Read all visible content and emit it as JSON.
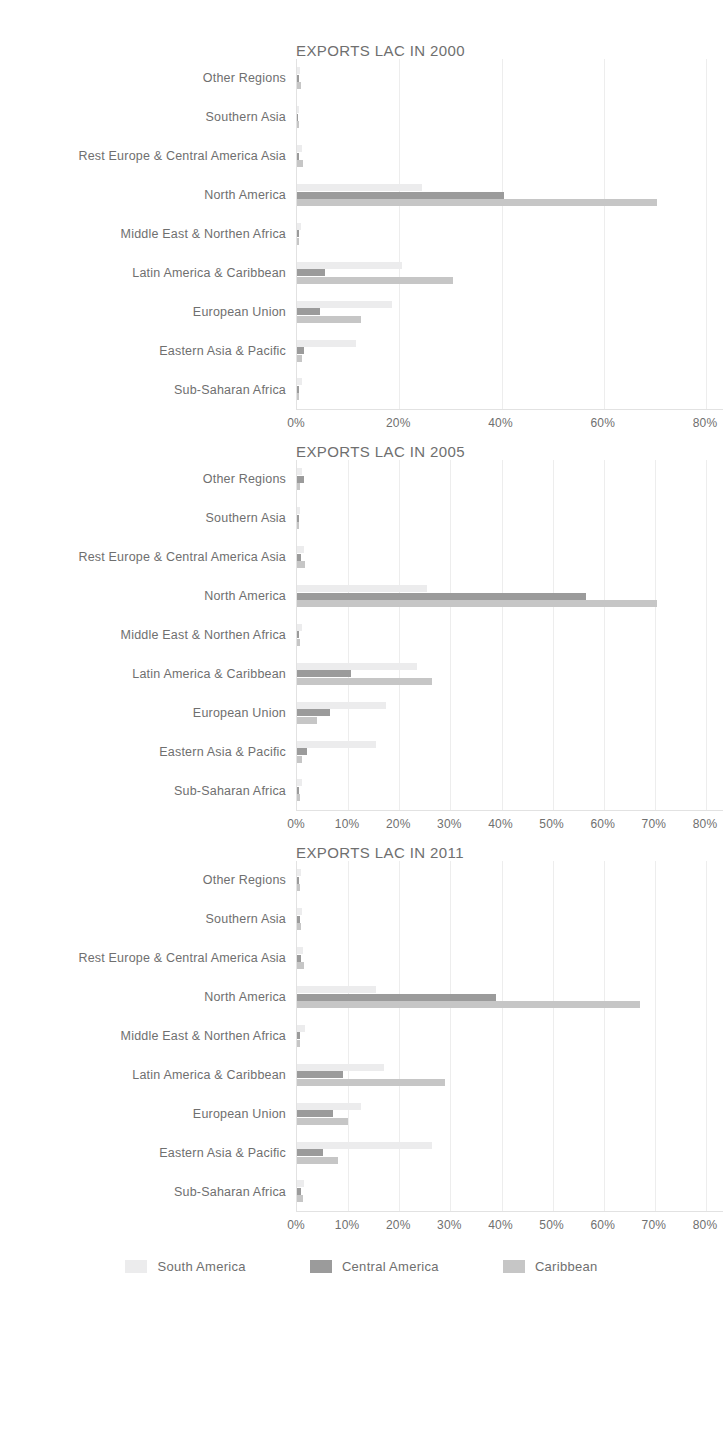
{
  "figure": {
    "series_colors": {
      "south_america": "#ececed",
      "central_america": "#9b9b9b",
      "caribbean": "#c6c6c6"
    }
  },
  "legend": {
    "position": "bottom",
    "items": [
      {
        "label": "South America",
        "swatch": "s0"
      },
      {
        "label": "Central America",
        "swatch": "s1"
      },
      {
        "label": "Caribbean",
        "swatch": "s2"
      }
    ]
  },
  "chart_data": [
    {
      "type": "bar",
      "orientation": "horizontal",
      "title": "EXPORTS LAC IN 2000",
      "xlabel": "",
      "ylabel": "",
      "xlim": [
        0,
        80
      ],
      "xticks": [
        0,
        20,
        40,
        60,
        80
      ],
      "xticklabels": [
        "0%",
        "20%",
        "40%",
        "60%",
        "80%"
      ],
      "grid": true,
      "categories": [
        "Other Regions",
        "Southern Asia",
        "Rest Europe & Central America Asia",
        "North America",
        "Middle East & Northen Africa",
        "Latin America & Caribbean",
        "European Union",
        "Eastern Asia & Pacific",
        "Sub-Saharan Africa"
      ],
      "series": [
        {
          "name": "South America",
          "values": [
            0.6,
            0.4,
            0.9,
            24.5,
            0.7,
            20.5,
            18.5,
            11.5,
            0.9
          ]
        },
        {
          "name": "Central America",
          "values": [
            0.3,
            0.2,
            0.4,
            40.5,
            0.3,
            5.5,
            4.5,
            1.4,
            0.3
          ]
        },
        {
          "name": "Caribbean",
          "values": [
            0.7,
            0.3,
            1.2,
            70.5,
            0.4,
            30.5,
            12.5,
            1.0,
            0.4
          ]
        }
      ]
    },
    {
      "type": "bar",
      "orientation": "horizontal",
      "title": "EXPORTS LAC IN 2005",
      "xlabel": "",
      "ylabel": "",
      "xlim": [
        0,
        80
      ],
      "xticks": [
        0,
        10,
        20,
        30,
        40,
        50,
        60,
        70,
        80
      ],
      "xticklabels": [
        "0%",
        "10%",
        "20%",
        "30%",
        "40%",
        "50%",
        "60%",
        "70%",
        "80%"
      ],
      "grid": true,
      "categories": [
        "Other Regions",
        "Southern Asia",
        "Rest Europe & Central America Asia",
        "North America",
        "Middle East & Northen Africa",
        "Latin America & Caribbean",
        "European Union",
        "Eastern Asia & Pacific",
        "Sub-Saharan Africa"
      ],
      "series": [
        {
          "name": "South America",
          "values": [
            1.0,
            0.5,
            1.3,
            25.5,
            0.9,
            23.5,
            17.5,
            15.5,
            1.0
          ]
        },
        {
          "name": "Central America",
          "values": [
            1.4,
            0.4,
            0.7,
            56.5,
            0.4,
            10.5,
            6.5,
            2.0,
            0.4
          ]
        },
        {
          "name": "Caribbean",
          "values": [
            0.5,
            0.3,
            1.5,
            70.5,
            0.5,
            26.5,
            4.0,
            1.0,
            0.5
          ]
        }
      ]
    },
    {
      "type": "bar",
      "orientation": "horizontal",
      "title": "EXPORTS LAC IN 2011",
      "xlabel": "",
      "ylabel": "",
      "xlim": [
        0,
        80
      ],
      "xticks": [
        0,
        10,
        20,
        30,
        40,
        50,
        60,
        70,
        80
      ],
      "xticklabels": [
        "0%",
        "10%",
        "20%",
        "30%",
        "40%",
        "50%",
        "60%",
        "70%",
        "80%"
      ],
      "grid": true,
      "categories": [
        "Other Regions",
        "Southern Asia",
        "Rest Europe & Central America Asia",
        "North America",
        "Middle East & Northen Africa",
        "Latin America & Caribbean",
        "European Union",
        "Eastern Asia & Pacific",
        "Sub-Saharan Africa"
      ],
      "series": [
        {
          "name": "South America",
          "values": [
            0.8,
            1.0,
            1.2,
            15.5,
            1.6,
            17.0,
            12.5,
            26.5,
            1.4
          ]
        },
        {
          "name": "Central America",
          "values": [
            0.4,
            0.6,
            0.7,
            39.0,
            0.5,
            9.0,
            7.0,
            5.0,
            0.7
          ]
        },
        {
          "name": "Caribbean",
          "values": [
            0.5,
            0.8,
            1.4,
            67.0,
            0.6,
            29.0,
            10.0,
            8.0,
            1.2
          ]
        }
      ]
    }
  ]
}
